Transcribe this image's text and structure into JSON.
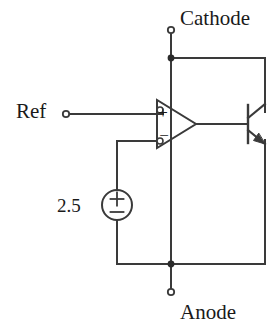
{
  "diagram": {
    "type": "circuit-schematic",
    "stroke_color": "#3a3a3a",
    "text_color": "#1a1a1a",
    "background_color": "#ffffff",
    "width": 280,
    "height": 335
  },
  "labels": {
    "cathode": "Cathode",
    "anode": "Anode",
    "ref": "Ref",
    "source_value": "2.5"
  },
  "components": {
    "opamp": {
      "name": "opamp",
      "plus_label": "+",
      "minus_label": "−",
      "noninverting_input": "Ref",
      "inverting_input": "2.5 V reference",
      "output": "transistor base"
    },
    "voltage_source": {
      "name": "dc-voltage-source",
      "value": "2.5",
      "plus_label": "+",
      "minus_label": "−"
    },
    "transistor": {
      "name": "npn-transistor",
      "type": "NPN",
      "collector": "Cathode",
      "emitter": "Anode",
      "base": "opamp output"
    }
  },
  "terminals": [
    {
      "name": "cathode-terminal",
      "label": "Cathode",
      "x": 171,
      "y": 30
    },
    {
      "name": "ref-terminal",
      "label": "Ref",
      "x": 66,
      "y": 114
    },
    {
      "name": "anode-terminal",
      "label": "Anode",
      "x": 171,
      "y": 292
    }
  ],
  "junctions": [
    {
      "name": "cathode-junction",
      "x": 171,
      "y": 58
    },
    {
      "name": "anode-junction",
      "x": 171,
      "y": 264
    }
  ]
}
